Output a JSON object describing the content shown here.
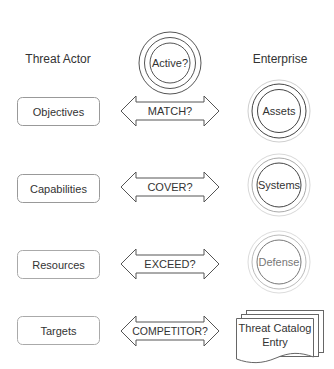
{
  "headers": {
    "left": "Threat Actor",
    "right": "Enterprise"
  },
  "center": {
    "label": "Active?"
  },
  "rows": [
    {
      "actor": "Objectives",
      "relation": "MATCH?",
      "enterprise": "Assets"
    },
    {
      "actor": "Capabilities",
      "relation": "COVER?",
      "enterprise": "Systems"
    },
    {
      "actor": "Resources",
      "relation": "EXCEED?",
      "enterprise": "Defense"
    },
    {
      "actor": "Targets",
      "relation": "COMPETITOR?",
      "enterprise_doc_line1": "Threat Catalog",
      "enterprise_doc_line2": "Entry"
    }
  ],
  "colors": {
    "stroke_dark": "#444444",
    "stroke_mid": "#888888",
    "stroke_light": "#bbbbbb",
    "stroke_faint": "#d4d4d4",
    "box_stroke": "#999999",
    "text": "#333333",
    "text_faded": "#777777"
  }
}
